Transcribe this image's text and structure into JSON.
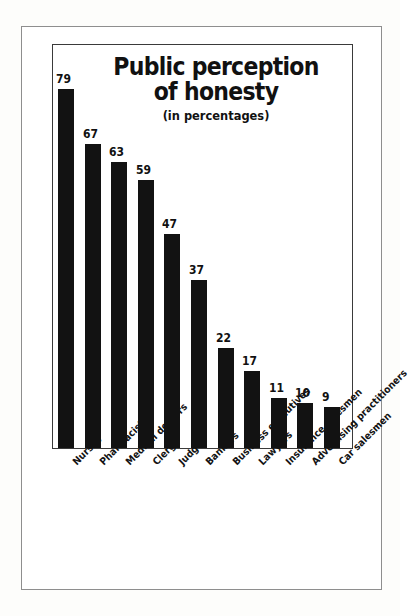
{
  "chart_data": {
    "type": "bar",
    "title": "Public perception of honesty",
    "title_line1": "Public perception",
    "title_line2": "of honesty",
    "subtitle": "(in percentages)",
    "xlabel": "",
    "ylabel": "",
    "ylim": [
      0,
      79
    ],
    "grid": false,
    "legend": "none",
    "bar_color": "#121212",
    "categories": [
      "Nurses",
      "Pharmacists",
      "Medical doctors",
      "Clergy",
      "Judges",
      "Bankers",
      "Business executives",
      "Lawyers",
      "Insurance salesmen",
      "Advertising practitioners",
      "Car salesmen"
    ],
    "values": [
      79,
      67,
      63,
      59,
      47,
      37,
      22,
      17,
      11,
      10,
      9
    ],
    "value_labels": [
      "79",
      "67",
      "63",
      "59",
      "47",
      "37",
      "22",
      "17",
      "11",
      "10",
      "9"
    ]
  }
}
